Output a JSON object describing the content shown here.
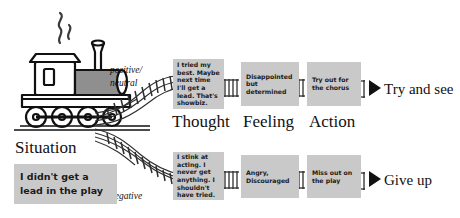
{
  "diagram": {
    "title_label": "Situation",
    "situation_note": "I didn't get a lead in the play",
    "columns": {
      "thought": "Thought",
      "feeling": "Feeling",
      "action": "Action"
    },
    "valence": {
      "positive": "positive/\nneutral",
      "negative": "negative"
    },
    "branches": [
      {
        "id": "positive",
        "thought": "I tried my best. Maybe next time I'll get a lead. That's showbiz.",
        "feeling": "Disappointed but determined",
        "action": "Try out for the chorus",
        "outcome": "Try and see"
      },
      {
        "id": "negative",
        "thought": "I stink at acting. I never get anything. I shouldn't have tried.",
        "feeling": "Angry, Discouraged",
        "action": "Miss out on the play",
        "outcome": "Give up"
      }
    ],
    "icons": {
      "train": "steam-locomotive-icon",
      "smoke": "smoke-puff-icon",
      "track": "railroad-track-icon",
      "arrow": "right-triangle-arrow-icon"
    },
    "colors": {
      "note_background": "#c9c9c9",
      "ink": "#111111",
      "train_body_fill": "#8f8f8f",
      "paper": "#ffffff"
    }
  }
}
